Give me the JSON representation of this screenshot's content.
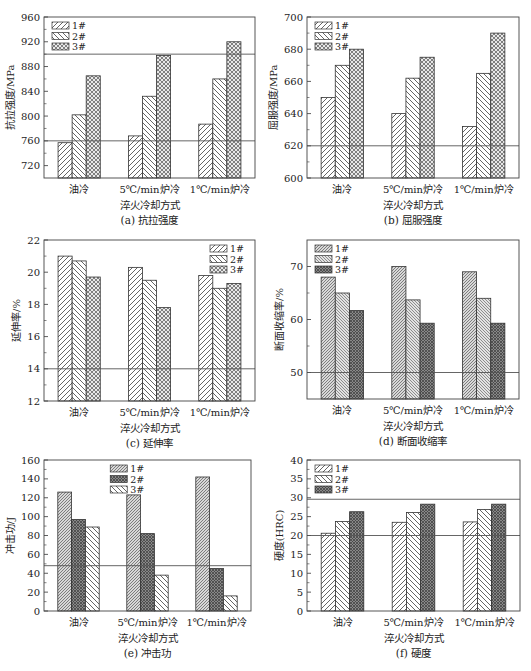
{
  "figure": {
    "xlabel": "淬火冷却方式",
    "categories": [
      "油冷",
      "5℃/min炉冷",
      "1℃/min炉冷"
    ],
    "legend": [
      "1#",
      "2#",
      "3#"
    ]
  },
  "chart_data": [
    {
      "type": "bar",
      "caption": "(a)  抗拉强度",
      "ylabel": "抗拉强度/MPa",
      "xlabel": "淬火冷却方式",
      "categories": [
        "油冷",
        "5℃/min炉冷",
        "1℃/min炉冷"
      ],
      "ylim": [
        700,
        960
      ],
      "yticks": [
        720,
        760,
        800,
        840,
        880,
        920,
        960
      ],
      "reference_lines": [
        760,
        900
      ],
      "legend_position": "top-left",
      "patterns": [
        "diag-right",
        "diag-left",
        "cross"
      ],
      "series": [
        {
          "name": "1#",
          "values": [
            757,
            768,
            787
          ]
        },
        {
          "name": "2#",
          "values": [
            802,
            832,
            860
          ]
        },
        {
          "name": "3#",
          "values": [
            865,
            898,
            920
          ]
        }
      ]
    },
    {
      "type": "bar",
      "caption": "(b)  屈服强度",
      "ylabel": "屈服强度/MPa",
      "xlabel": "淬火冷却方式",
      "categories": [
        "油冷",
        "5℃/min炉冷",
        "1℃/min炉冷"
      ],
      "ylim": [
        600,
        700
      ],
      "yticks": [
        600,
        620,
        640,
        660,
        680,
        700
      ],
      "reference_lines": [
        620
      ],
      "legend_position": "top-left",
      "patterns": [
        "diag-right",
        "diag-left",
        "cross"
      ],
      "series": [
        {
          "name": "1#",
          "values": [
            650,
            640,
            632
          ]
        },
        {
          "name": "2#",
          "values": [
            670,
            662,
            665
          ]
        },
        {
          "name": "3#",
          "values": [
            680,
            675,
            690
          ]
        }
      ]
    },
    {
      "type": "bar",
      "caption": "(c)  延伸率",
      "ylabel": "延伸率/%",
      "xlabel": "淬火冷却方式",
      "categories": [
        "油冷",
        "5℃/min炉冷",
        "1℃/min炉冷"
      ],
      "ylim": [
        12,
        22
      ],
      "yticks": [
        12,
        14,
        16,
        18,
        20,
        22
      ],
      "reference_lines": [
        14
      ],
      "legend_position": "top-right",
      "patterns": [
        "diag-right",
        "diag-left",
        "cross"
      ],
      "series": [
        {
          "name": "1#",
          "values": [
            21.0,
            20.3,
            19.8
          ]
        },
        {
          "name": "2#",
          "values": [
            20.7,
            19.5,
            19.0
          ]
        },
        {
          "name": "3#",
          "values": [
            19.7,
            17.8,
            19.3
          ]
        }
      ]
    },
    {
      "type": "bar",
      "caption": "(d)  断面收缩率",
      "ylabel": "断面收缩率/%",
      "xlabel": "淬火冷却方式",
      "categories": [
        "油冷",
        "5℃/min炉冷",
        "1℃/min炉冷"
      ],
      "ylim": [
        45,
        75
      ],
      "yticks": [
        50,
        60,
        70
      ],
      "reference_lines": [
        50
      ],
      "legend_position": "top-left",
      "patterns": [
        "dense-right",
        "dense-left",
        "dark-cross"
      ],
      "series": [
        {
          "name": "1#",
          "values": [
            68,
            70,
            69
          ]
        },
        {
          "name": "2#",
          "values": [
            65,
            63.7,
            64
          ]
        },
        {
          "name": "3#",
          "values": [
            61.7,
            59.3,
            59.3
          ]
        }
      ]
    },
    {
      "type": "bar",
      "caption": "(e)  冲击功",
      "ylabel": "冲击功/J",
      "xlabel": "淬火冷却方式",
      "categories": [
        "油冷",
        "5℃/min炉冷",
        "1℃/min炉冷"
      ],
      "ylim": [
        0,
        160
      ],
      "yticks": [
        0,
        20,
        40,
        60,
        80,
        100,
        120,
        140,
        160
      ],
      "reference_lines": [
        48
      ],
      "legend_position": "top-center",
      "patterns": [
        "dense-right",
        "dark-cross",
        "diag-left"
      ],
      "series": [
        {
          "name": "1#",
          "values": [
            126,
            123,
            142
          ]
        },
        {
          "name": "2#",
          "values": [
            97,
            82,
            45
          ]
        },
        {
          "name": "3#",
          "values": [
            89,
            38,
            16
          ]
        }
      ]
    },
    {
      "type": "bar",
      "caption": "(f)  硬度",
      "ylabel": "硬度(HRC)",
      "xlabel": "淬火冷却方式",
      "categories": [
        "油冷",
        "5℃/min炉冷",
        "1℃/min炉冷"
      ],
      "ylim": [
        0,
        40
      ],
      "yticks": [
        0,
        5,
        10,
        15,
        20,
        25,
        30,
        35,
        40
      ],
      "reference_lines": [
        20,
        29.6
      ],
      "legend_position": "top-left",
      "patterns": [
        "diag-right",
        "diag-left",
        "dark-cross"
      ],
      "series": [
        {
          "name": "1#",
          "values": [
            20.6,
            23.5,
            23.6
          ]
        },
        {
          "name": "2#",
          "values": [
            23.7,
            26.1,
            26.9
          ]
        },
        {
          "name": "3#",
          "values": [
            26.3,
            28.3,
            28.3
          ]
        }
      ]
    }
  ]
}
